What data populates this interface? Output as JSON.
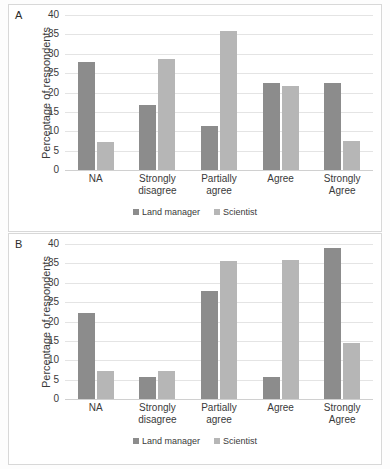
{
  "figure": {
    "panels": [
      {
        "label": "A",
        "ylabel": "Percentage of respondents",
        "yticks": [
          "40",
          "35",
          "30",
          "25",
          "20",
          "15",
          "10",
          "5",
          "0"
        ]
      },
      {
        "label": "B",
        "ylabel": "Percentage of respondents",
        "yticks": [
          "40",
          "35",
          "30",
          "25",
          "20",
          "15",
          "10",
          "5",
          "0"
        ]
      }
    ],
    "legend": [
      {
        "label": "Land manager",
        "color": "#8c8c8c"
      },
      {
        "label": "Scientist",
        "color": "#b6b6b6"
      }
    ]
  },
  "chart_data": [
    {
      "type": "bar",
      "panel": "A",
      "title": "",
      "xlabel": "",
      "ylabel": "Percentage of respondents",
      "ylim": [
        0,
        40
      ],
      "ytick_step": 5,
      "grid": true,
      "legend_position": "bottom",
      "categories": [
        "NA",
        "Strongly disagree",
        "Partially agree",
        "Agree",
        "Strongly Agree"
      ],
      "series": [
        {
          "name": "Land manager",
          "color": "#8c8c8c",
          "values": [
            27.8,
            16.8,
            11.3,
            22.4,
            22.5
          ]
        },
        {
          "name": "Scientist",
          "color": "#b6b6b6",
          "values": [
            7.2,
            28.6,
            35.8,
            21.6,
            7.5
          ]
        }
      ]
    },
    {
      "type": "bar",
      "panel": "B",
      "title": "",
      "xlabel": "",
      "ylabel": "Percentage of respondents",
      "ylim": [
        0,
        40
      ],
      "ytick_step": 5,
      "grid": true,
      "legend_position": "bottom",
      "categories": [
        "NA",
        "Strongly disagree",
        "Partially agree",
        "Agree",
        "Strongly Agree"
      ],
      "series": [
        {
          "name": "Land manager",
          "color": "#8c8c8c",
          "values": [
            22.1,
            5.7,
            28.0,
            5.7,
            39.1
          ]
        },
        {
          "name": "Scientist",
          "color": "#b6b6b6",
          "values": [
            7.2,
            7.2,
            35.7,
            35.9,
            14.5
          ]
        }
      ]
    }
  ]
}
